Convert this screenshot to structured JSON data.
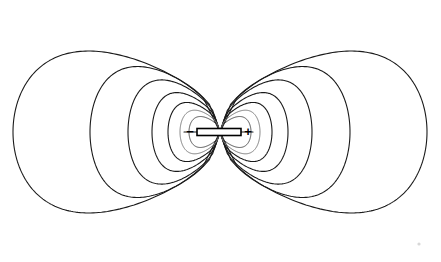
{
  "figure": {
    "width": 441,
    "height": 262,
    "background_color": "#ffffff",
    "line_color": "#1a1a1a",
    "faint_line_color": "#7a7a7a"
  },
  "dipole": {
    "bar_label": "dipole-bar",
    "negative_charge_symbol": "−",
    "positive_charge_symbol": "+",
    "negative_charge_x": 190,
    "positive_charge_x": 247,
    "axis_y": 132,
    "bar_left_x": 197,
    "bar_right_x": 241,
    "bar_height": 7,
    "center_x": 220
  },
  "chart_data": {
    "type": "line",
    "xlabel": "",
    "ylabel": "",
    "xlim": [
      0,
      441
    ],
    "ylim": [
      0,
      262
    ],
    "grid": false,
    "legend_position": "none",
    "annotations": [
      {
        "text": "−",
        "x": 190,
        "y": 132,
        "name": "negative-charge"
      },
      {
        "text": "+",
        "x": 247,
        "y": 132,
        "name": "positive-charge"
      }
    ],
    "series": [
      {
        "name": "left-loop-1-outermost",
        "lobe": "left",
        "half_width": 207,
        "half_height": 115,
        "style": "bold"
      },
      {
        "name": "left-loop-2",
        "lobe": "left",
        "half_width": 130,
        "half_height": 93,
        "style": "bold"
      },
      {
        "name": "left-loop-3",
        "lobe": "left",
        "half_width": 92,
        "half_height": 74,
        "style": "bold"
      },
      {
        "name": "left-loop-4",
        "lobe": "left",
        "half_width": 68,
        "half_height": 56,
        "style": "bold"
      },
      {
        "name": "left-loop-5",
        "lobe": "left",
        "half_width": 52,
        "half_height": 42,
        "style": "bold"
      },
      {
        "name": "left-loop-6",
        "lobe": "left",
        "half_width": 40,
        "half_height": 31,
        "style": "faint"
      },
      {
        "name": "left-loop-7-innermost",
        "lobe": "left",
        "half_width": 31,
        "half_height": 22,
        "style": "thin"
      },
      {
        "name": "right-loop-1-outermost",
        "lobe": "right",
        "half_width": 207,
        "half_height": 115,
        "style": "bold"
      },
      {
        "name": "right-loop-2",
        "lobe": "right",
        "half_width": 130,
        "half_height": 93,
        "style": "bold"
      },
      {
        "name": "right-loop-3",
        "lobe": "right",
        "half_width": 92,
        "half_height": 74,
        "style": "bold"
      },
      {
        "name": "right-loop-4",
        "lobe": "right",
        "half_width": 68,
        "half_height": 56,
        "style": "bold"
      },
      {
        "name": "right-loop-5",
        "lobe": "right",
        "half_width": 52,
        "half_height": 42,
        "style": "bold"
      },
      {
        "name": "right-loop-6",
        "lobe": "right",
        "half_width": 40,
        "half_height": 31,
        "style": "faint"
      },
      {
        "name": "right-loop-7-innermost",
        "lobe": "right",
        "half_width": 31,
        "half_height": 22,
        "style": "thin"
      }
    ]
  }
}
